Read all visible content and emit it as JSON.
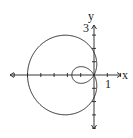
{
  "chart_data": {
    "type": "line",
    "subtype": "polar",
    "title": "",
    "xlabel": "x",
    "ylabel": "y",
    "tick_labels": {
      "x": [
        "1"
      ],
      "y": [
        "3"
      ]
    },
    "x_ticks": [
      -6,
      -5,
      -4,
      -3,
      -2,
      -1,
      1,
      2
    ],
    "y_ticks": [
      -4,
      -3,
      -2,
      -1,
      1,
      2,
      3
    ],
    "xlim": [
      -6,
      2
    ],
    "ylim": [
      -4,
      3
    ],
    "grid": false,
    "legend": false,
    "key_points": [
      {
        "label": "outer loop leftmost",
        "x": -5,
        "y": 0
      },
      {
        "label": "outer loop crosses y-axis",
        "x": 0,
        "y": 1.7
      },
      {
        "label": "outer loop crosses y-axis",
        "x": 0,
        "y": -1.7
      },
      {
        "label": "inner loop leftmost",
        "x": -1,
        "y": 0
      },
      {
        "label": "pole",
        "x": 0,
        "y": 0
      }
    ]
  },
  "labels": {
    "x_axis": "x",
    "y_axis": "y",
    "x_tick": "1",
    "y_tick": "3"
  }
}
